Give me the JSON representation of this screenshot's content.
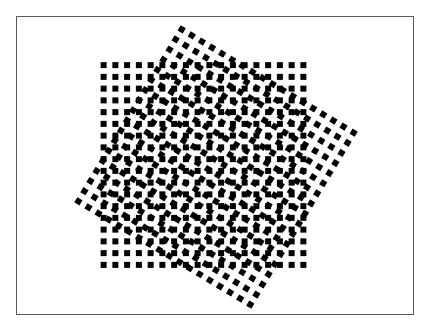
{
  "figure": {
    "background_color": "#ffffff",
    "frame_color": "#5a5a5a",
    "dot_color": "#000000"
  },
  "grids": [
    {
      "name": "upright-grid",
      "center": [
        203.5,
        165
      ],
      "rows": 18,
      "cols": 18,
      "spacing": 11.75,
      "dot_size": 6,
      "rotation_deg": 0
    },
    {
      "name": "rotated-grid",
      "center": [
        216,
        167
      ],
      "rows": 18,
      "cols": 18,
      "spacing": 11.8,
      "dot_size": 6,
      "rotation_deg": 31
    }
  ]
}
